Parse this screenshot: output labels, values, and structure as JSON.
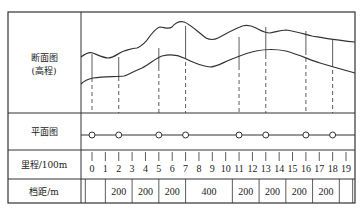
{
  "rows": {
    "profile": {
      "label_line1": "断面图",
      "label_line2": "(高程)"
    },
    "plan": {
      "label": "平面图"
    },
    "chainage": {
      "label": "里程/100m"
    },
    "span": {
      "label": "档距/m"
    }
  },
  "chainage_ticks": [
    "0",
    "1",
    "2",
    "3",
    "4",
    "5",
    "6",
    "7",
    "8",
    "9",
    "10",
    "11",
    "12",
    "13",
    "14",
    "15",
    "16",
    "17",
    "18",
    "19"
  ],
  "tower_positions": [
    0,
    2,
    5,
    7,
    11,
    13,
    16,
    18
  ],
  "spans": [
    {
      "from": 0,
      "to": 1.5,
      "value": ""
    },
    {
      "from": 1.5,
      "to": 3.5,
      "value": "200"
    },
    {
      "from": 3.5,
      "to": 5.5,
      "value": "200"
    },
    {
      "from": 5.5,
      "to": 7.5,
      "value": "200"
    },
    {
      "from": 7.5,
      "to": 11,
      "value": "400"
    },
    {
      "from": 11,
      "to": 13,
      "value": "200"
    },
    {
      "from": 13,
      "to": 15,
      "value": "200"
    },
    {
      "from": 15,
      "to": 17,
      "value": "200"
    },
    {
      "from": 17,
      "to": 19,
      "value": "200"
    },
    {
      "from": 19,
      "to": 20,
      "value": ""
    }
  ],
  "colors": {
    "line": "#333333",
    "frame": "#333333",
    "background": "#ffffff"
  }
}
